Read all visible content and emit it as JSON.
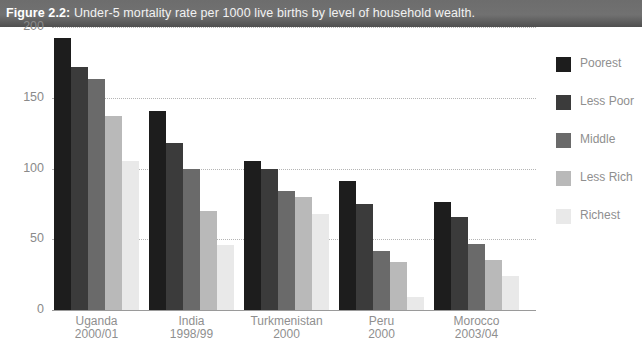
{
  "caption": {
    "label": "Figure 2.2:",
    "text": " Under-5 mortality rate per 1000 live births by level of household wealth."
  },
  "chart_data": {
    "type": "bar",
    "title": "Under-5 mortality rate per 1000 live births by level of household wealth.",
    "xlabel": "",
    "ylabel": "",
    "ylim": [
      0,
      200
    ],
    "yticks": [
      0,
      50,
      100,
      150,
      200
    ],
    "ytick_labels": [
      "0",
      "50",
      "100",
      "150",
      "200"
    ],
    "grid": "horizontal-dotted",
    "legend_position": "right",
    "categories": [
      "Uganda\n2000/01",
      "India\n1998/99",
      "Turkmenistan\n2000",
      "Peru\n2000",
      "Morocco\n2003/04"
    ],
    "category_lines": [
      [
        "Uganda",
        "2000/01"
      ],
      [
        "India",
        "1998/99"
      ],
      [
        "Turkmenistan",
        "2000"
      ],
      [
        "Peru",
        "2000"
      ],
      [
        "Morocco",
        "2003/04"
      ]
    ],
    "series": [
      {
        "name": "Poorest",
        "color": "#1d1d1d",
        "values": [
          192,
          141,
          105,
          91,
          76
        ]
      },
      {
        "name": "Less Poor",
        "color": "#3b3b3b",
        "values": [
          172,
          118,
          100,
          75,
          66
        ]
      },
      {
        "name": "Middle",
        "color": "#6a6a6a",
        "values": [
          163,
          100,
          84,
          42,
          47
        ]
      },
      {
        "name": "Less Rich",
        "color": "#b9b9b9",
        "values": [
          137,
          70,
          80,
          34,
          35
        ]
      },
      {
        "name": "Richest",
        "color": "#e9e9e9",
        "values": [
          105,
          46,
          68,
          9,
          24
        ]
      }
    ]
  }
}
